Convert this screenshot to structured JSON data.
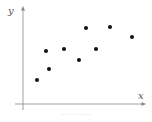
{
  "chart_data": {
    "type": "scatter",
    "title": "",
    "xlabel": "x",
    "ylabel": "y",
    "grid": false,
    "legend": null,
    "ticks": false,
    "points": [
      {
        "x": 37,
        "y": 80
      },
      {
        "x": 46,
        "y": 51
      },
      {
        "x": 49,
        "y": 69
      },
      {
        "x": 64,
        "y": 49
      },
      {
        "x": 79,
        "y": 60
      },
      {
        "x": 86,
        "y": 28
      },
      {
        "x": 96,
        "y": 49
      },
      {
        "x": 110,
        "y": 27
      },
      {
        "x": 132,
        "y": 37
      }
    ],
    "point_color": "#111111",
    "axis_color": "#888888"
  },
  "caption": "··· ····· ······"
}
